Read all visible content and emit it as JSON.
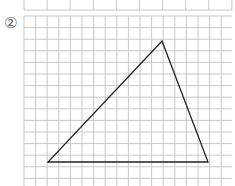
{
  "problem": {
    "number_label": "②"
  },
  "grid": {
    "color": "#c8c8c8",
    "cell": 11.6
  },
  "triangle": {
    "stroke": "#222222",
    "points": "48,162 208,162 162,41"
  }
}
